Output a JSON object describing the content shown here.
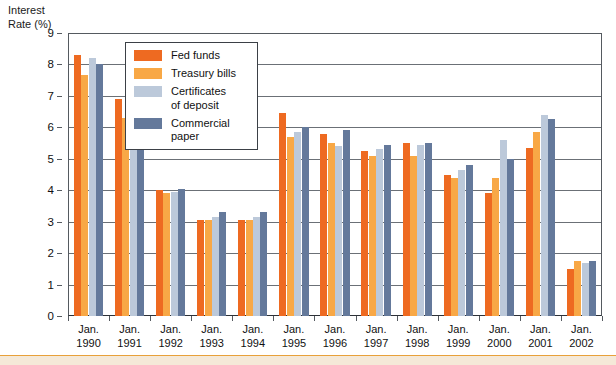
{
  "chart": {
    "axis_title": "Interest\nRate (%)"
  },
  "legend": {
    "items": [
      {
        "label": "Fed funds",
        "color": "#ee6a21"
      },
      {
        "label": "Treasury bills",
        "color": "#f8a846"
      },
      {
        "label": "Certificates\nof deposit",
        "color": "#bcc9da"
      },
      {
        "label": "Commercial\npaper",
        "color": "#64799b"
      }
    ]
  },
  "chart_data": {
    "type": "bar",
    "title": "",
    "xlabel": "",
    "ylabel": "Interest Rate (%)",
    "ylim": [
      0,
      9
    ],
    "yticks": [
      0,
      1,
      2,
      3,
      4,
      5,
      6,
      7,
      8,
      9
    ],
    "grid": true,
    "legend_position": "inside-top-left",
    "categories": [
      "Jan.\n1990",
      "Jan.\n1991",
      "Jan.\n1992",
      "Jan.\n1993",
      "Jan.\n1994",
      "Jan.\n1995",
      "Jan.\n1996",
      "Jan.\n1997",
      "Jan.\n1998",
      "Jan.\n1999",
      "Jan.\n2000",
      "Jan.\n2001",
      "Jan.\n2002"
    ],
    "series": [
      {
        "name": "Fed funds",
        "color": "#ee6a21",
        "values": [
          8.3,
          6.9,
          4.0,
          3.05,
          3.05,
          6.45,
          5.8,
          5.25,
          5.5,
          4.5,
          3.9,
          5.35,
          1.5
        ]
      },
      {
        "name": "Treasury bills",
        "color": "#f8a846",
        "values": [
          7.65,
          6.3,
          3.9,
          3.05,
          3.05,
          5.7,
          5.5,
          5.1,
          5.1,
          4.4,
          4.4,
          5.85,
          1.75
        ]
      },
      {
        "name": "Certificates of deposit",
        "color": "#bcc9da",
        "values": [
          8.2,
          7.1,
          3.95,
          3.15,
          3.15,
          5.85,
          5.4,
          5.3,
          5.45,
          4.65,
          5.6,
          6.4,
          1.7
        ]
      },
      {
        "name": "Commercial paper",
        "color": "#64799b",
        "values": [
          8.0,
          7.0,
          4.05,
          3.3,
          3.3,
          6.0,
          5.9,
          5.45,
          5.5,
          4.8,
          5.0,
          6.25,
          1.75
        ]
      }
    ]
  }
}
